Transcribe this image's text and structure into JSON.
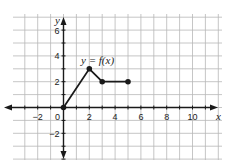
{
  "chart_data": {
    "type": "line",
    "title": "",
    "function_label": "y = f(x)",
    "xlabel": "x",
    "ylabel": "y",
    "xlim": [
      -4,
      12
    ],
    "ylim": [
      -4,
      7
    ],
    "x_ticks": [
      -2,
      0,
      2,
      4,
      6,
      8,
      10
    ],
    "y_ticks": [
      -2,
      2,
      4,
      6
    ],
    "grid": true,
    "series": [
      {
        "name": "f(x)",
        "points": [
          [
            0,
            0
          ],
          [
            2,
            3
          ],
          [
            3,
            2
          ],
          [
            5,
            2
          ]
        ],
        "marker": "filled-circle"
      }
    ],
    "colors": {
      "grid": "#b8b8b8",
      "axis": "#1a1a1a",
      "line": "#1a1a1a"
    }
  }
}
